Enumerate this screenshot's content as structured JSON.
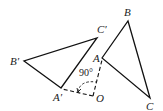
{
  "diagram": {
    "type": "geometry-rotation",
    "points": {
      "A": {
        "label": "A",
        "x": 102,
        "y": 58
      },
      "B": {
        "label": "B",
        "x": 128,
        "y": 21
      },
      "C": {
        "label": "C",
        "x": 150,
        "y": 98
      },
      "A_prime": {
        "label": "A′",
        "x": 61,
        "y": 88
      },
      "B_prime": {
        "label": "B′",
        "x": 24,
        "y": 61
      },
      "C_prime": {
        "label": "C′",
        "x": 97,
        "y": 38
      },
      "O": {
        "label": "O",
        "x": 93,
        "y": 96
      }
    },
    "angle_label": "90°",
    "stroke_color": "#111111"
  }
}
